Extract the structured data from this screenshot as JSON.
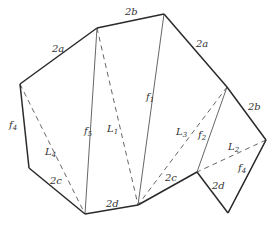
{
  "diagram": {
    "type": "polygon-fold-pattern",
    "stroke_color": "#2a2a2a",
    "fold_color": "#555555",
    "vertices": {
      "A": [
        20,
        84
      ],
      "B": [
        97,
        28
      ],
      "C": [
        164,
        14
      ],
      "D": [
        227,
        87
      ],
      "E": [
        266,
        140
      ],
      "F": [
        228,
        213
      ],
      "G": [
        197,
        172
      ],
      "H": [
        138,
        205
      ],
      "P": [
        85,
        214
      ],
      "J": [
        29,
        168
      ]
    },
    "outer_edges": [
      {
        "from": "A",
        "to": "B",
        "label": "2a"
      },
      {
        "from": "B",
        "to": "C",
        "label": "2b"
      },
      {
        "from": "C",
        "to": "D",
        "label": "2a"
      },
      {
        "from": "D",
        "to": "E",
        "label": "2b"
      },
      {
        "from": "E",
        "to": "F",
        "label": ""
      },
      {
        "from": "F",
        "to": "G",
        "label": "2d"
      },
      {
        "from": "G",
        "to": "H",
        "label": "2c"
      },
      {
        "from": "H",
        "to": "P",
        "label": "2d"
      },
      {
        "from": "P",
        "to": "J",
        "label": "2c"
      },
      {
        "from": "J",
        "to": "A",
        "label": "f4"
      }
    ],
    "solid_inner": [
      {
        "from": "B",
        "to": "P",
        "label": "f5"
      },
      {
        "from": "C",
        "to": "H",
        "label": "f1"
      },
      {
        "from": "D",
        "to": "G",
        "label": "f2"
      },
      {
        "from": "E",
        "to": "F",
        "label": "f4"
      }
    ],
    "dashed_inner": [
      {
        "from": "A",
        "to": "P",
        "label": "L4"
      },
      {
        "from": "B",
        "to": "H",
        "label": "L1"
      },
      {
        "from": "D",
        "to": "H",
        "label": "L3"
      },
      {
        "from": "E",
        "to": "G",
        "label": "L2"
      }
    ],
    "labels": [
      {
        "text": "2a",
        "x": 52,
        "y": 52
      },
      {
        "text": "2b",
        "x": 125,
        "y": 15
      },
      {
        "text": "2a",
        "x": 196,
        "y": 47
      },
      {
        "text": "2b",
        "x": 248,
        "y": 110
      },
      {
        "text": "f",
        "sub": "4",
        "x": 9,
        "y": 128
      },
      {
        "text": "L",
        "sub": "4",
        "x": 45,
        "y": 155
      },
      {
        "text": "2c",
        "x": 50,
        "y": 184
      },
      {
        "text": "2d",
        "x": 106,
        "y": 207
      },
      {
        "text": "f",
        "sub": "5",
        "x": 84,
        "y": 134
      },
      {
        "text": "L",
        "sub": "1",
        "x": 107,
        "y": 132
      },
      {
        "text": "f",
        "sub": "1",
        "x": 146,
        "y": 100
      },
      {
        "text": "L",
        "sub": "3",
        "x": 176,
        "y": 135
      },
      {
        "text": "f",
        "sub": "2",
        "x": 198,
        "y": 138
      },
      {
        "text": "2c",
        "x": 165,
        "y": 181
      },
      {
        "text": "L",
        "sub": "2",
        "x": 228,
        "y": 150
      },
      {
        "text": "f",
        "sub": "4",
        "x": 238,
        "y": 171
      },
      {
        "text": "2d",
        "x": 212,
        "y": 189
      }
    ]
  }
}
